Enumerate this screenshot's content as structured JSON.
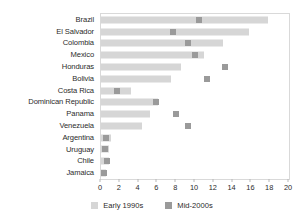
{
  "chart_data": {
    "type": "bar",
    "title": "",
    "subtitle": "",
    "xlabel": "",
    "ylabel": "",
    "xlim": [
      0,
      20
    ],
    "xticks": [
      0,
      2,
      4,
      6,
      8,
      10,
      12,
      14,
      16,
      18,
      20
    ],
    "grid": false,
    "legend_position": "bottom",
    "orientation": "horizontal",
    "categories": [
      "Brazil",
      "El Salvador",
      "Colombia",
      "Mexico",
      "Honduras",
      "Bolivia",
      "Costa Rica",
      "Dominican Republic",
      "Panama",
      "Venezuela",
      "Argentina",
      "Uruguay",
      "Chile",
      "Jamaica"
    ],
    "series": [
      {
        "name": "Early 1990s",
        "render": "bar",
        "color": "#d6d6d6",
        "values": [
          17.8,
          15.7,
          13.0,
          11.0,
          8.5,
          7.4,
          3.2,
          6.1,
          5.2,
          4.4,
          1.1,
          0.9,
          0.8,
          0.5
        ]
      },
      {
        "name": "Mid-2000s",
        "render": "marker",
        "color": "#9a9a9a",
        "values": [
          10.4,
          7.7,
          9.3,
          10.0,
          13.2,
          11.3,
          1.7,
          5.8,
          8.0,
          9.3,
          0.5,
          0.4,
          0.6,
          0.3
        ]
      }
    ],
    "legend": [
      "Early 1990s",
      "Mid-2000s"
    ]
  },
  "legend": {
    "early_label": "Early 1990s",
    "mid_label": "Mid-2000s"
  }
}
